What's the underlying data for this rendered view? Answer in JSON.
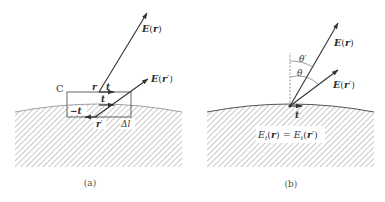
{
  "figure": {
    "panel_a": {
      "caption": "(a)",
      "contour_label": "C",
      "vectors": {
        "E_r": {
          "label_main": "E",
          "label_arg": "r"
        },
        "E_r_prime": {
          "label_main": "E",
          "label_arg": "r",
          "label_prime": "′"
        }
      },
      "tangent_labels": {
        "top_point": "r",
        "top_t": "t",
        "mid_t": "t",
        "bottom_minus_t": "−t",
        "bottom_point": "r",
        "bottom_point_prime": "′",
        "delta_l": "Δl"
      }
    },
    "panel_b": {
      "caption": "(b)",
      "vectors": {
        "E_r": {
          "label_main": "E",
          "label_arg": "r"
        },
        "E_r_prime": {
          "label_main": "E",
          "label_arg": "r",
          "label_prime": "′"
        }
      },
      "angles": {
        "theta_prime": "θ′",
        "theta": "θ"
      },
      "tangent_label": "t",
      "equation": {
        "lhs_main": "E",
        "lhs_sub": "t",
        "lhs_arg": "r",
        "eq": "=",
        "rhs_main": "E",
        "rhs_sub": "t",
        "rhs_arg": "r",
        "rhs_prime": "′"
      }
    },
    "colors": {
      "stroke": "#3a3a3a",
      "hatch": "#9a9a9a",
      "background": "#ffffff"
    }
  }
}
